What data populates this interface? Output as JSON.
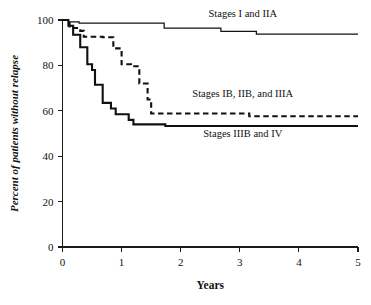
{
  "chart_data": {
    "type": "line",
    "subtype": "kaplan-meier-step",
    "title": "",
    "xlabel": "Years",
    "ylabel": "Percent of patients without relapse",
    "xlim": [
      0,
      5
    ],
    "ylim": [
      0,
      100
    ],
    "xticks": [
      0,
      1,
      2,
      3,
      4,
      5
    ],
    "xtick_labels": [
      "0",
      "1",
      "2",
      "3",
      "4",
      "5"
    ],
    "yticks": [
      0,
      20,
      40,
      60,
      80,
      100
    ],
    "ytick_labels": [
      "0",
      "20",
      "40",
      "60",
      "80",
      "100"
    ],
    "grid": false,
    "legend_position": "inline-annotations",
    "series": [
      {
        "name": "Stages I and IIA",
        "style": "solid-thin",
        "color": "#111111",
        "label_x": 3.05,
        "label_y": 101.5,
        "label_anchor": "middle",
        "x": [
          0.0,
          0.05,
          0.1,
          0.2,
          0.28,
          0.45,
          1.68,
          1.72,
          2.62,
          2.68,
          3.22,
          3.28,
          5.0
        ],
        "y": [
          100.0,
          100.0,
          99.2,
          99.2,
          98.6,
          98.6,
          98.6,
          96.4,
          96.4,
          95.0,
          95.0,
          93.8,
          93.8
        ]
      },
      {
        "name": "Stages IB, IIB, and IIIA",
        "style": "dashed",
        "color": "#111111",
        "label_x": 3.05,
        "label_y": 66.0,
        "label_anchor": "middle",
        "x": [
          0.0,
          0.06,
          0.12,
          0.18,
          0.3,
          0.36,
          0.62,
          0.68,
          0.8,
          0.86,
          0.95,
          1.0,
          1.1,
          1.16,
          1.25,
          1.3,
          1.38,
          1.44,
          1.5,
          3.1,
          3.16,
          5.0
        ],
        "y": [
          100.0,
          100.0,
          96.5,
          96.5,
          95.2,
          92.6,
          92.6,
          92.4,
          92.4,
          87.5,
          87.5,
          80.5,
          80.5,
          79.6,
          79.6,
          72.0,
          72.0,
          65.0,
          58.8,
          58.8,
          57.6,
          57.6
        ]
      },
      {
        "name": "Stages IIIB and IV",
        "style": "solid-thick",
        "color": "#111111",
        "label_x": 3.05,
        "label_y": 48.5,
        "label_anchor": "middle",
        "x": [
          0.0,
          0.06,
          0.1,
          0.14,
          0.18,
          0.22,
          0.3,
          0.34,
          0.42,
          0.46,
          0.5,
          0.55,
          0.62,
          0.68,
          0.76,
          0.82,
          0.9,
          1.02,
          1.12,
          1.2,
          1.68,
          1.74,
          5.0
        ],
        "y": [
          100.0,
          100.0,
          97.5,
          97.5,
          93.5,
          93.5,
          88.0,
          88.0,
          80.5,
          80.5,
          78.0,
          71.5,
          71.5,
          63.5,
          63.5,
          61.0,
          58.5,
          58.5,
          56.0,
          54.0,
          54.0,
          53.3,
          53.3
        ]
      }
    ]
  },
  "axis": {
    "x_title": "Years",
    "y_title": "Percent of patients without relapse"
  }
}
